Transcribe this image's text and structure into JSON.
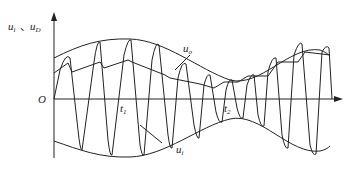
{
  "diagram": {
    "type": "waveform",
    "labels": {
      "y_axis": {
        "u1": "u",
        "u1_sub": "i",
        "sep": "、",
        "u2": "u",
        "u2_sub": "D"
      },
      "origin": "O",
      "t1": {
        "text": "t",
        "sub": "1"
      },
      "t2": {
        "text": "t",
        "sub": "2"
      },
      "uo": {
        "text": "u",
        "sub": "o"
      },
      "ui": {
        "text": "u",
        "sub": "i"
      }
    }
  }
}
